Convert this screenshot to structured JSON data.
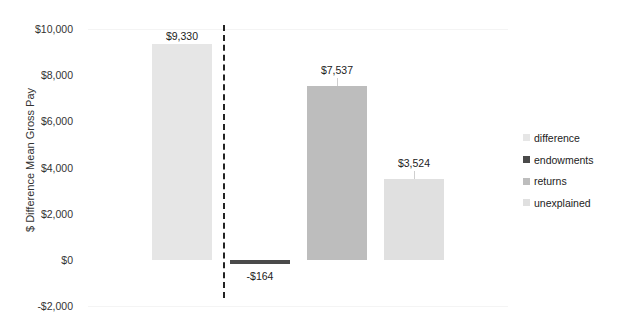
{
  "chart_data": {
    "type": "bar",
    "title": "",
    "xlabel": "",
    "ylabel": "$ Difference Mean Gross Pay",
    "ylim": [
      -2000,
      10000
    ],
    "yticks": [
      10000,
      8000,
      6000,
      4000,
      2000,
      0,
      -2000
    ],
    "ytick_labels": [
      "$10,000",
      "$8,000",
      "$6,000",
      "$4,000",
      "$2,000",
      "$0",
      "-$2,000"
    ],
    "categories": [
      "difference",
      "endowments",
      "returns",
      "unexplained"
    ],
    "values": [
      9330,
      -164,
      7537,
      3524
    ],
    "data_labels": [
      "$9,330",
      "-$164",
      "$7,537",
      "$3,524"
    ],
    "colors": [
      "#e6e6e6",
      "#4a4a4a",
      "#bdbdbd",
      "#e0e0e0"
    ],
    "legend": {
      "position": "right",
      "entries": [
        "difference",
        "endowments",
        "returns",
        "unexplained"
      ]
    },
    "annotations": [
      "dashed vertical separator between difference and decomposition bars"
    ],
    "grid": false
  },
  "axis": {
    "ylabel": "$ Difference Mean Gross Pay",
    "ticks": [
      {
        "label": "$10,000",
        "value": 10000
      },
      {
        "label": "$8,000",
        "value": 8000
      },
      {
        "label": "$6,000",
        "value": 6000
      },
      {
        "label": "$4,000",
        "value": 4000
      },
      {
        "label": "$2,000",
        "value": 2000
      },
      {
        "label": "$0",
        "value": 0
      },
      {
        "label": "-$2,000",
        "value": -2000
      }
    ]
  },
  "legend": {
    "items": [
      {
        "label": "difference",
        "color": "#e6e6e6"
      },
      {
        "label": "endowments",
        "color": "#4a4a4a"
      },
      {
        "label": "returns",
        "color": "#bdbdbd"
      },
      {
        "label": "unexplained",
        "color": "#e0e0e0"
      }
    ]
  }
}
